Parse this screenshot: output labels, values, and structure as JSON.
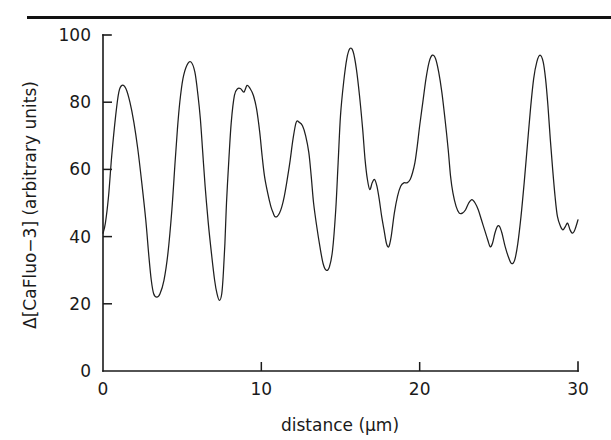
{
  "figure": {
    "top_rule_color": "#111111",
    "background_color": "#ffffff",
    "curve_color": "#1f1f1f",
    "axis_color": "#1a1a1a"
  },
  "chart_data": {
    "type": "line",
    "title": "",
    "xlabel": "distance (μm)",
    "ylabel": "Δ[CaFluo−3] (arbitrary units)",
    "xlim": [
      0,
      30
    ],
    "ylim": [
      0,
      100
    ],
    "xticks": [
      0,
      10,
      20,
      30
    ],
    "xtick_labels": [
      "0",
      "10",
      "20",
      "30"
    ],
    "yticks": [
      0,
      20,
      40,
      60,
      80,
      100
    ],
    "ytick_labels": [
      "0",
      "20",
      "40",
      "60",
      "80",
      "100"
    ],
    "grid": false,
    "legend": null,
    "series": [
      {
        "name": "CaFluo-3 fluorescence profile",
        "x": [
          0.0,
          0.15,
          0.35,
          0.55,
          0.8,
          1.0,
          1.2,
          1.45,
          1.7,
          1.95,
          2.2,
          2.45,
          2.7,
          2.9,
          3.05,
          3.2,
          3.4,
          3.6,
          3.85,
          4.1,
          4.35,
          4.55,
          4.7,
          4.85,
          5.05,
          5.3,
          5.55,
          5.8,
          6.0,
          6.15,
          6.3,
          6.45,
          6.65,
          6.85,
          7.05,
          7.2,
          7.35,
          7.5,
          7.6,
          7.7,
          7.8,
          7.95,
          8.1,
          8.3,
          8.5,
          8.7,
          8.9,
          9.1,
          9.3,
          9.5,
          9.7,
          9.9,
          10.05,
          10.2,
          10.4,
          10.6,
          10.75,
          10.85,
          11.0,
          11.15,
          11.3,
          11.45,
          11.6,
          11.8,
          12.0,
          12.2,
          12.4,
          12.6,
          12.8,
          13.0,
          13.15,
          13.3,
          13.5,
          13.7,
          13.9,
          14.1,
          14.3,
          14.5,
          14.7,
          14.85,
          15.0,
          15.2,
          15.4,
          15.6,
          15.8,
          16.0,
          16.2,
          16.4,
          16.55,
          16.7,
          16.85,
          17.0,
          17.15,
          17.3,
          17.45,
          17.6,
          17.75,
          17.9,
          18.05,
          18.2,
          18.4,
          18.6,
          18.8,
          19.0,
          19.2,
          19.4,
          19.55,
          19.7,
          19.85,
          20.0,
          20.2,
          20.4,
          20.6,
          20.8,
          21.0,
          21.2,
          21.4,
          21.6,
          21.8,
          21.95,
          22.1,
          22.3,
          22.5,
          22.7,
          22.9,
          23.1,
          23.3,
          23.5,
          23.7,
          23.9,
          24.1,
          24.3,
          24.45,
          24.6,
          24.75,
          24.9,
          25.05,
          25.2,
          25.4,
          25.6,
          25.8,
          26.0,
          26.2,
          26.4,
          26.6,
          26.8,
          27.0,
          27.2,
          27.4,
          27.6,
          27.8,
          27.95,
          28.1,
          28.25,
          28.4,
          28.55,
          28.7,
          28.9,
          29.05,
          29.2,
          29.35,
          29.5,
          29.65,
          29.8,
          30.0
        ],
        "y": [
          41,
          44,
          52,
          64,
          76,
          83,
          85,
          84,
          80,
          74,
          66,
          56,
          45,
          34,
          27,
          23,
          22,
          23,
          27,
          35,
          48,
          62,
          72,
          80,
          87,
          91,
          92,
          89,
          82,
          75,
          65,
          55,
          44,
          35,
          27,
          23,
          21,
          23,
          29,
          38,
          50,
          63,
          74,
          82,
          84,
          84,
          83,
          85,
          84,
          82,
          78,
          71,
          64,
          58,
          53,
          49,
          47,
          46,
          46,
          47,
          49,
          52,
          56,
          62,
          69,
          74,
          74,
          73,
          70,
          65,
          58,
          50,
          43,
          37,
          32,
          30,
          31,
          36,
          48,
          62,
          76,
          86,
          93,
          96,
          95,
          90,
          82,
          72,
          63,
          57,
          54,
          56,
          57,
          55,
          51,
          46,
          42,
          38,
          37,
          40,
          47,
          52,
          55,
          56,
          56,
          57,
          59,
          62,
          67,
          73,
          80,
          87,
          92,
          94,
          93,
          89,
          83,
          75,
          66,
          58,
          53,
          49,
          47,
          47,
          48,
          50,
          51,
          50,
          48,
          45,
          42,
          39,
          37,
          38,
          41,
          43,
          43,
          41,
          37,
          34,
          32,
          33,
          38,
          46,
          56,
          67,
          78,
          87,
          92,
          94,
          92,
          87,
          79,
          69,
          60,
          52,
          46,
          43,
          42,
          43,
          44,
          42,
          41,
          42,
          45
        ]
      }
    ],
    "peaks": [
      {
        "x": 1.2,
        "y": 85
      },
      {
        "x": 4.6,
        "y": 92
      },
      {
        "x": 7.5,
        "y": 85
      },
      {
        "x": 11.2,
        "y": 74
      },
      {
        "x": 14.5,
        "y": 96
      },
      {
        "x": 18.0,
        "y": 94
      },
      {
        "x": 21.0,
        "y": 89
      },
      {
        "x": 24.0,
        "y": 94
      },
      {
        "x": 29.2,
        "y": 96
      }
    ],
    "troughs": [
      {
        "x": 3.2,
        "y": 22
      },
      {
        "x": 6.4,
        "y": 21
      },
      {
        "x": 10.1,
        "y": 46
      },
      {
        "x": 13.3,
        "y": 30
      },
      {
        "x": 16.9,
        "y": 37
      },
      {
        "x": 20.5,
        "y": 45
      },
      {
        "x": 24.5,
        "y": 32
      },
      {
        "x": 27.9,
        "y": 41
      }
    ]
  }
}
